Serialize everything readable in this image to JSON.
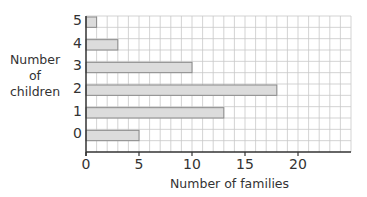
{
  "chart_data": {
    "type": "bar",
    "orientation": "horizontal",
    "title": "",
    "xlabel": "Number of families",
    "ylabel": "Number of children",
    "ylabel_lines": [
      "Number",
      "of",
      "children"
    ],
    "categories": [
      "0",
      "1",
      "2",
      "3",
      "4",
      "5"
    ],
    "values": [
      5,
      13,
      18,
      10,
      3,
      1
    ],
    "xlim": [
      0,
      25
    ],
    "xticks": [
      0,
      5,
      10,
      15,
      20
    ],
    "grid": true,
    "grid_minor_step": 1,
    "legend": null
  },
  "colors": {
    "bar_fill": "#dcdcdc",
    "bar_edge": "#8a8a8a",
    "grid": "#c8c8c8",
    "axis": "#333333"
  }
}
